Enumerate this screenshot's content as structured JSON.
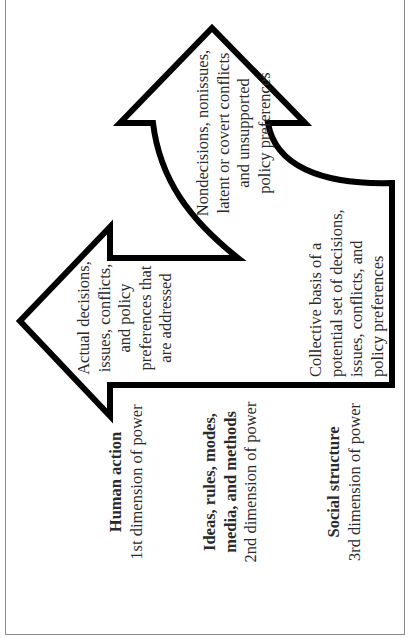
{
  "diagram": {
    "orientation": "rotated-90-ccw",
    "colors": {
      "outline": "#000000",
      "text": "#2a2a2a",
      "frame": "#8a8a8a",
      "background": "#ffffff"
    },
    "arrows": {
      "upper_arrow": {
        "label_lines": [
          "Nondecisions, nonissues,",
          "latent or covert conflicts",
          "and unsupported",
          "policy preferences"
        ]
      },
      "left_arrow": {
        "label_lines": [
          "Actual decisions,",
          "issues, conflicts,",
          "and policy",
          "preferences that",
          "are addressed"
        ]
      },
      "base": {
        "label_lines": [
          "Collective basis of a",
          "potential set of decisions,",
          "issues, conflicts, and",
          "policy preferences"
        ]
      }
    },
    "dimensions": [
      {
        "title_lines": [
          "Human action"
        ],
        "subtitle": "1st dimension of power"
      },
      {
        "title_lines": [
          "Ideas, rules, modes,",
          "media, and methods"
        ],
        "subtitle": "2nd dimension of power"
      },
      {
        "title_lines": [
          "Social structure"
        ],
        "subtitle": "3rd dimension of power"
      }
    ]
  }
}
